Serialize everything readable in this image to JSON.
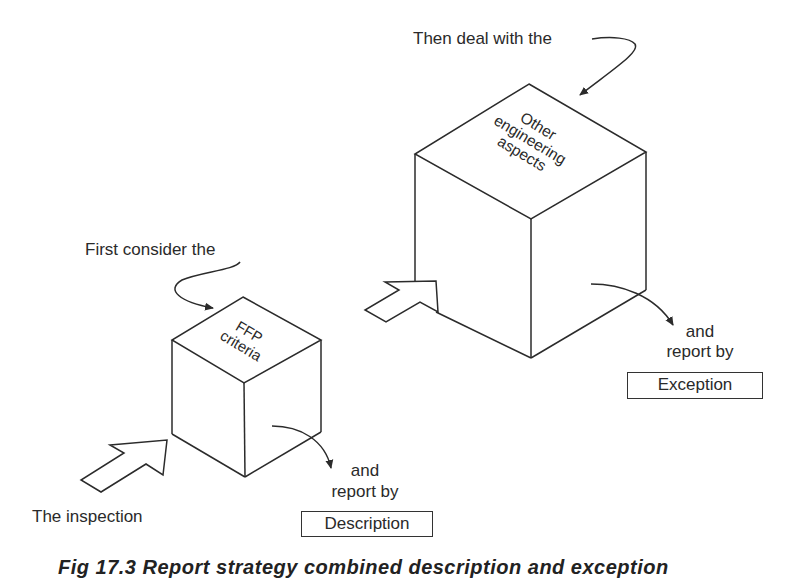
{
  "labels": {
    "then_deal": "Then deal with the",
    "first_consider": "First consider the",
    "the_inspection": "The inspection",
    "and_1": "and",
    "report_by_1": "report by",
    "and_2": "and",
    "report_by_2": "report by"
  },
  "cubes": {
    "large": {
      "top_face_lines": [
        "Other",
        "engineering",
        "aspects"
      ]
    },
    "small": {
      "top_face_lines": [
        "FFP",
        "criteria"
      ]
    }
  },
  "boxes": {
    "exception": "Exception",
    "description": "Description"
  },
  "caption": "Fig 17.3   Report strategy combined description and exception",
  "colors": {
    "line": "#2b2b2b",
    "background": "#ffffff"
  }
}
